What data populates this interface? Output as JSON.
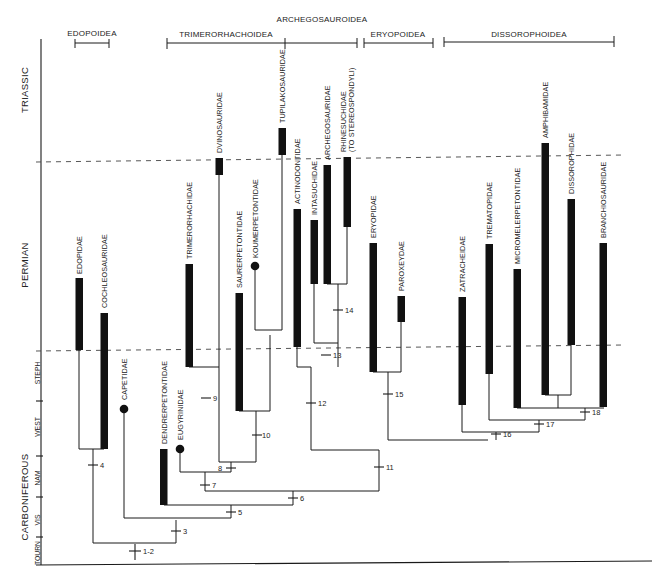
{
  "figure": {
    "type": "cladogram",
    "width": 652,
    "height": 582,
    "colors": {
      "ink": "#1a1a1a",
      "bar": "#111111",
      "dash": "#555555",
      "paper": "#ffffff"
    }
  },
  "superfamily_brackets": [
    {
      "label": "EDOPOIDEA",
      "x1": 75,
      "x2": 109,
      "y": 43,
      "label_x": 92,
      "label_y": 36
    },
    {
      "label": "TRIMERORHACHOIDEA",
      "x1": 167,
      "x2": 285,
      "y": 43,
      "label_x": 226,
      "label_y": 37
    },
    {
      "label": "ARCHEGOSAUROIDEA",
      "x1": 285,
      "x2": 357,
      "y": 43,
      "label_x": 322,
      "label_y": 22
    },
    {
      "label": "ERYOPOIDEA",
      "x1": 364,
      "x2": 433,
      "y": 43,
      "label_x": 398,
      "label_y": 37
    },
    {
      "label": "DISSOROPHOIDEA",
      "x1": 444,
      "x2": 614,
      "y": 43,
      "label_x": 529,
      "label_y": 37
    }
  ],
  "time_axis": {
    "periods": [
      {
        "label": "TRIASSIC",
        "y_center": 90
      },
      {
        "label": "PERMIAN",
        "y_center": 265
      },
      {
        "label": "CARBONIFEROUS",
        "y_center": 497
      }
    ],
    "subdivisions": [
      {
        "label": "STEPH",
        "y_center": 373
      },
      {
        "label": "WEST",
        "y_center": 427
      },
      {
        "label": "NAM",
        "y_center": 478
      },
      {
        "label": "VIS",
        "y_center": 520
      },
      {
        "label": "TOURN",
        "y_center": 553
      }
    ],
    "subdivision_ticks_y": [
      401,
      456,
      497,
      537
    ],
    "boundaries": [
      {
        "name": "Permian-Triassic",
        "y_left": 162,
        "y_right": 155
      },
      {
        "name": "Carboniferous-Permian",
        "y_left": 350,
        "y_right": 345
      }
    ]
  },
  "taxa": [
    {
      "name": "EDOPIDAE",
      "x": 79,
      "bar_top": 278,
      "bar_bottom": 350,
      "terminal": "bar"
    },
    {
      "name": "COCHLEOSAURIDAE",
      "x": 104,
      "bar_top": 313,
      "bar_bottom": 449,
      "terminal": "bar"
    },
    {
      "name": "CAPETIDAE",
      "x": 124,
      "dot_y": 409,
      "terminal": "dot"
    },
    {
      "name": "DENDRERPETONTIDAE",
      "x": 164,
      "bar_top": 449,
      "bar_bottom": 505,
      "terminal": "bar"
    },
    {
      "name": "EUGYRINIDAE",
      "x": 180,
      "dot_y": 449,
      "terminal": "dot"
    },
    {
      "name": "TRIMERORHACHIDAE",
      "x": 189,
      "bar_top": 264,
      "bar_bottom": 367,
      "terminal": "bar"
    },
    {
      "name": "DVINOSAURIDAE",
      "x": 219,
      "bar_top": 158,
      "bar_bottom": 175,
      "terminal": "bar"
    },
    {
      "name": "SAURERPETONTIDAE",
      "x": 239,
      "bar_top": 293,
      "bar_bottom": 411,
      "terminal": "bar"
    },
    {
      "name": "KOUMERPETONTIDAE",
      "x": 255,
      "dot_y": 266,
      "terminal": "dot"
    },
    {
      "name": "TUPILAKOSAURIDAE",
      "x": 282,
      "bar_top": 128,
      "bar_bottom": 155,
      "terminal": "bar"
    },
    {
      "name": "ACTINODONTIDAE",
      "x": 297,
      "bar_top": 209,
      "bar_bottom": 347,
      "terminal": "bar"
    },
    {
      "name": "INTASUCHIDAE",
      "x": 314,
      "bar_top": 220,
      "bar_bottom": 284,
      "terminal": "bar"
    },
    {
      "name": "ARCHEGOSAURIDAE",
      "x": 327,
      "bar_top": 165,
      "bar_bottom": 284,
      "terminal": "bar"
    },
    {
      "name": "RHINESUCHIDAE (TO STEREOSPONDYLI)",
      "x": 347,
      "bar_top": 157,
      "bar_bottom": 227,
      "terminal": "bar"
    },
    {
      "name": "ERYOPIDAE",
      "x": 373,
      "bar_top": 243,
      "bar_bottom": 372,
      "terminal": "bar"
    },
    {
      "name": "PAROXEYDAE",
      "x": 401,
      "bar_top": 296,
      "bar_bottom": 322,
      "terminal": "bar"
    },
    {
      "name": "ZATRACHEIDAE",
      "x": 462,
      "bar_top": 297,
      "bar_bottom": 405,
      "terminal": "bar"
    },
    {
      "name": "TREMATOPIDAE",
      "x": 489,
      "bar_top": 244,
      "bar_bottom": 374,
      "terminal": "bar"
    },
    {
      "name": "MICROMELERPETONTIDAE",
      "x": 517,
      "bar_top": 269,
      "bar_bottom": 408,
      "terminal": "bar"
    },
    {
      "name": "AMPHIBAMIDAE",
      "x": 545,
      "bar_top": 143,
      "bar_bottom": 395,
      "terminal": "bar"
    },
    {
      "name": "DISSOROPHIDAE",
      "x": 571,
      "bar_top": 199,
      "bar_bottom": 345,
      "terminal": "bar"
    },
    {
      "name": "BRANCHIOSAURIDAE",
      "x": 603,
      "bar_top": 243,
      "bar_bottom": 407,
      "terminal": "bar"
    }
  ],
  "nodes": [
    {
      "label": "1-2",
      "x": 135,
      "y": 551
    },
    {
      "label": "3",
      "x": 176,
      "y": 531
    },
    {
      "label": "4",
      "x": 93,
      "y": 465
    },
    {
      "label": "5",
      "x": 231,
      "y": 512
    },
    {
      "label": "6",
      "x": 293,
      "y": 498
    },
    {
      "label": "7",
      "x": 205,
      "y": 485
    },
    {
      "label": "8",
      "x": 231,
      "y": 468
    },
    {
      "label": "9",
      "x": 206,
      "y": 398
    },
    {
      "label": "10",
      "x": 257,
      "y": 435
    },
    {
      "label": "11",
      "x": 379,
      "y": 467
    },
    {
      "label": "12",
      "x": 312,
      "y": 403
    },
    {
      "label": "13",
      "x": 326,
      "y": 355
    },
    {
      "label": "14",
      "x": 338,
      "y": 310
    },
    {
      "label": "15",
      "x": 388,
      "y": 394
    },
    {
      "label": "16",
      "x": 496,
      "y": 434
    },
    {
      "label": "17",
      "x": 539,
      "y": 424
    },
    {
      "label": "18",
      "x": 585,
      "y": 412
    }
  ]
}
